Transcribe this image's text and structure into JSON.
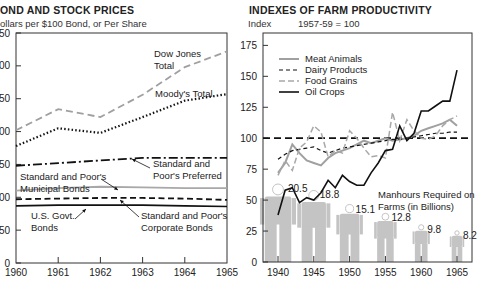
{
  "left": {
    "title": "OND AND STOCK PRICES",
    "subtitle": "ollars per $100 Bond, or Per Share"
  },
  "right": {
    "title": "INDEXES OF FARM PRODUCTIVITY",
    "subtitle_index": "Index",
    "subtitle_base": "1957-59 = 100"
  },
  "chart_data": [
    {
      "type": "line",
      "title": "BOND AND STOCK PRICES",
      "ylabel": "Dollars per $100 Bond, or Per Share",
      "xlabel": "",
      "x": [
        1960,
        1961,
        1962,
        1963,
        1964,
        1965
      ],
      "ylim": [
        0,
        350
      ],
      "yticks": [
        0,
        50,
        100,
        150,
        200,
        250,
        300,
        350
      ],
      "ytick_labels": [
        "0",
        "50",
        "00",
        "50",
        "00",
        "50",
        "00",
        "50"
      ],
      "grid": false,
      "series": [
        {
          "name": "Dow Jones Total",
          "style": "dashed-gray",
          "values": [
            202,
            234,
            222,
            256,
            298,
            322
          ]
        },
        {
          "name": "Moody's Total",
          "style": "dotted-black",
          "values": [
            178,
            205,
            198,
            222,
            247,
            257
          ]
        },
        {
          "name": "Standard and Poor's Preferred",
          "style": "dashdot-black",
          "values": [
            148,
            152,
            156,
            160,
            160,
            160
          ]
        },
        {
          "name": "Standard and Poor's Municipal Bonds",
          "style": "solid-gray",
          "values": [
            110,
            114,
            116,
            115,
            114,
            114
          ]
        },
        {
          "name": "Standard and Poor's Corporate Bonds",
          "style": "dashed-black",
          "values": [
            97,
            98,
            99,
            99,
            98,
            96
          ]
        },
        {
          "name": "U.S. Govt. Bonds",
          "style": "solid-black",
          "values": [
            87,
            88,
            88,
            88,
            87,
            86
          ]
        }
      ],
      "annotations": [
        "Dow Jones Total",
        "Moody's Total",
        "Standard and Poor's Preferred",
        "Standard and Poor's Municipal Bonds",
        "U.S. Govt. Bonds",
        "Standard and Poor's Corporate Bonds"
      ]
    },
    {
      "type": "line",
      "title": "INDEXES OF FARM PRODUCTIVITY",
      "ylabel": "Index 1957-59 = 100",
      "xlabel": "",
      "x_ticks": [
        1940,
        1945,
        1950,
        1955,
        1960,
        1965
      ],
      "ylim": [
        0,
        185
      ],
      "yticks": [
        0,
        25,
        50,
        75,
        100,
        125,
        150,
        175
      ],
      "grid": false,
      "legend": [
        "Meat Animals",
        "Dairy Products",
        "Food Grains",
        "Oil Crops"
      ],
      "legend_position": "upper left",
      "years": [
        1940,
        1941,
        1942,
        1943,
        1944,
        1945,
        1946,
        1947,
        1948,
        1949,
        1950,
        1951,
        1952,
        1953,
        1954,
        1955,
        1956,
        1957,
        1958,
        1959,
        1960,
        1961,
        1962,
        1963,
        1964,
        1965
      ],
      "series": [
        {
          "name": "Meat Animals",
          "style": "solid-gray",
          "values": [
            72,
            80,
            95,
            88,
            82,
            80,
            78,
            84,
            88,
            90,
            92,
            95,
            98,
            96,
            98,
            100,
            98,
            99,
            100,
            102,
            106,
            108,
            110,
            112,
            115,
            110
          ]
        },
        {
          "name": "Dairy Products",
          "style": "dashed-black",
          "values": [
            83,
            87,
            90,
            91,
            92,
            93,
            90,
            88,
            90,
            92,
            93,
            94,
            95,
            96,
            97,
            98,
            99,
            99,
            100,
            101,
            102,
            103,
            104,
            104,
            105,
            105
          ]
        },
        {
          "name": "Food Grains",
          "style": "dashed-gray",
          "values": [
            70,
            82,
            74,
            92,
            97,
            110,
            105,
            85,
            90,
            88,
            106,
            100,
            92,
            85,
            86,
            84,
            121,
            98,
            115,
            106,
            100,
            99,
            102,
            110,
            115,
            118
          ]
        },
        {
          "name": "Oil Crops",
          "style": "solid-black",
          "values": [
            38,
            58,
            60,
            48,
            52,
            50,
            56,
            66,
            60,
            70,
            65,
            62,
            62,
            72,
            80,
            90,
            91,
            110,
            98,
            104,
            122,
            122,
            126,
            130,
            130,
            155
          ]
        }
      ],
      "baseline_100": true,
      "manhours_required_billions": {
        "label": "Manhours Required on Farms (in Billions)",
        "years": [
          1940,
          1945,
          1950,
          1955,
          1960,
          1965
        ],
        "values": [
          20.5,
          18.8,
          15.1,
          12.8,
          9.8,
          8.2
        ]
      }
    }
  ]
}
